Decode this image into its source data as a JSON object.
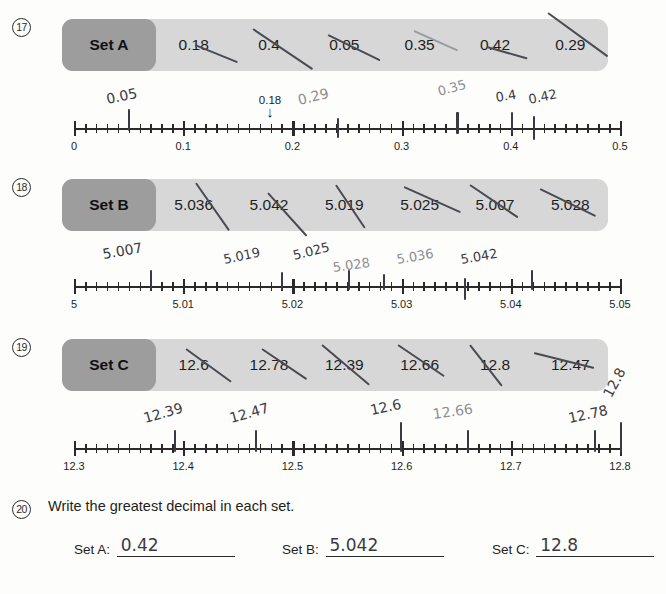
{
  "worksheet": {
    "problems": [
      {
        "number": "17",
        "set_label": "Set A",
        "decimals": [
          "0.18",
          "0.4",
          "0.05",
          "0.35",
          "0.42",
          "0.29"
        ],
        "numberline": {
          "min": 0,
          "max": 0.5,
          "major_step": 0.1,
          "minor_step": 0.01,
          "tick_labels": [
            "0",
            "0.1",
            "0.2",
            "0.3",
            "0.4",
            "0.5"
          ],
          "printed_callout": {
            "value": 0.18,
            "label": "0.18",
            "arrow": "↓"
          },
          "student_marks": [
            {
              "value": 0.05,
              "label": "0.05"
            },
            {
              "value": 0.24,
              "label": ""
            },
            {
              "value": 0.29,
              "label": "0.29"
            },
            {
              "value": 0.35,
              "label": "0.35"
            },
            {
              "value": 0.4,
              "label": "0.4"
            },
            {
              "value": 0.42,
              "label": "0.42"
            }
          ]
        }
      },
      {
        "number": "18",
        "set_label": "Set B",
        "decimals": [
          "5.036",
          "5.042",
          "5.019",
          "5.025",
          "5.007",
          "5.028"
        ],
        "numberline": {
          "min": 5,
          "max": 5.05,
          "major_step": 0.01,
          "minor_step": 0.001,
          "tick_labels": [
            "5",
            "5.01",
            "5.02",
            "5.03",
            "5.04",
            "5.05"
          ],
          "printed_callout": null,
          "student_marks": [
            {
              "value": 5.007,
              "label": "5.007"
            },
            {
              "value": 5.019,
              "label": "5.019"
            },
            {
              "value": 5.025,
              "label": "5.025"
            },
            {
              "value": 5.028,
              "label": "5.028"
            },
            {
              "value": 5.036,
              "label": "5.036"
            },
            {
              "value": 5.042,
              "label": "5.042"
            }
          ]
        }
      },
      {
        "number": "19",
        "set_label": "Set C",
        "decimals": [
          "12.6",
          "12.78",
          "12.39",
          "12.66",
          "12.8",
          "12.47"
        ],
        "numberline": {
          "min": 12.3,
          "max": 12.8,
          "major_step": 0.1,
          "minor_step": 0.01,
          "tick_labels": [
            "12.3",
            "12.4",
            "12.5",
            "12.6",
            "12.7",
            "12.8"
          ],
          "printed_callout": null,
          "student_marks": [
            {
              "value": 12.39,
              "label": "12.39"
            },
            {
              "value": 12.47,
              "label": "12.47"
            },
            {
              "value": 12.6,
              "label": "12.6"
            },
            {
              "value": 12.66,
              "label": "12.66"
            },
            {
              "value": 12.78,
              "label": "12.78"
            },
            {
              "value": 12.8,
              "label": "12.8"
            }
          ]
        }
      }
    ],
    "question20": {
      "number": "20",
      "prompt": "Write the greatest decimal in each set.",
      "answers": [
        {
          "label": "Set A:",
          "value": "0.42"
        },
        {
          "label": "Set B:",
          "value": "5.042"
        },
        {
          "label": "Set C:",
          "value": "12.8"
        }
      ]
    }
  }
}
